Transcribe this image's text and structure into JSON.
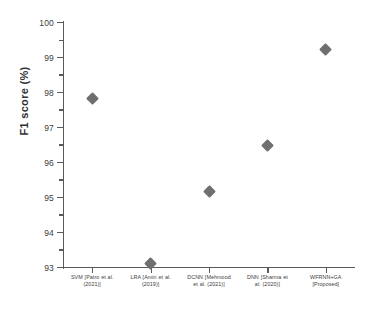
{
  "chart_data": {
    "type": "scatter",
    "title": "",
    "xlabel": "",
    "ylabel": "F1 score (%)",
    "ylim": [
      92.4,
      100
    ],
    "xlim": [
      0,
      5
    ],
    "grid": false,
    "legend": "none",
    "marker": {
      "shape": "diamond",
      "color": "#6f6f6f",
      "size": 9
    },
    "categories": [
      "SVM [Patro et al. (2021)]",
      "LRA [Amin et al. (2019)]",
      "DCNN [Mehmood et al. (2021)]",
      "DNN [Sharma et al. (2020)]",
      "WFRNN+GA [Proposed]"
    ],
    "values": [
      97.8,
      93.1,
      95.15,
      96.47,
      99.2
    ],
    "yticks": [
      93,
      94,
      95,
      96,
      97,
      98,
      99,
      100
    ],
    "ytick_labels": [
      "93",
      "94",
      "95",
      "96",
      "97",
      "98",
      "99",
      "100"
    ],
    "yminor_ticks": [
      93.5,
      94.5,
      95.5,
      96.5,
      97.5,
      98.5,
      99.5
    ],
    "series": [
      {
        "name": "F1 score",
        "points": [
          {
            "category": "SVM [Patro et al. (2021)]",
            "value": 97.8
          },
          {
            "category": "LRA [Amin et al. (2019)]",
            "value": 93.1
          },
          {
            "category": "DCNN [Mehmood et al. (2021)]",
            "value": 95.15
          },
          {
            "category": "DNN [Sharma et al. (2020)]",
            "value": 96.47
          },
          {
            "category": "WFRNN+GA [Proposed]",
            "value": 99.2
          }
        ]
      }
    ]
  },
  "axes": {
    "y_axis_title": "F1 score (%)",
    "tick_0": "93",
    "tick_1": "94",
    "tick_2": "95",
    "tick_3": "96",
    "tick_4": "97",
    "tick_5": "98",
    "tick_6": "99",
    "tick_7": "100"
  },
  "categories_display": {
    "cat_0_line1": "SVM [Patro et al.",
    "cat_0_line2": "(2021)]",
    "cat_1_line1": "LRA [Amin et al.",
    "cat_1_line2": "(2019)]",
    "cat_2_line1": "DCNN [Mehmood",
    "cat_2_line2": "et al. (2021)]",
    "cat_3_line1": "DNN [Sharma et",
    "cat_3_line2": "al. (2020)]",
    "cat_4_line1": "WFRNN+GA",
    "cat_4_line2": "[Proposed]"
  }
}
